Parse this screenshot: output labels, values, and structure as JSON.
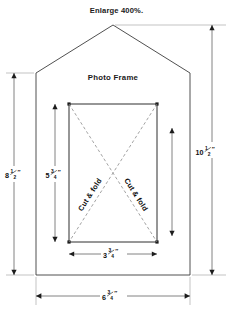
{
  "page": {
    "title": "Enlarge 400%.",
    "background_color": "#ffffff",
    "width": 233,
    "height": 312
  },
  "diagram": {
    "name": "photo-frame-cutting-template",
    "frame_label": "Photo Frame",
    "fold_label_left": "Cut & fold",
    "fold_label_right": "Cut & fold",
    "line_color": "#3c3c3c",
    "dash_color": "#8c8c8c",
    "dimension_color": "#5a5a5a"
  },
  "dimensions": [
    {
      "id": "overall-height-left",
      "value": "8",
      "fraction_num": "1",
      "fraction_den": "2",
      "unit": "″",
      "label": "8 1/2\"",
      "orientation": "vertical"
    },
    {
      "id": "opening-height",
      "value": "5",
      "fraction_num": "3",
      "fraction_den": "4",
      "unit": "″",
      "label": "5 3/4\"",
      "orientation": "vertical"
    },
    {
      "id": "overall-height-right",
      "value": "10",
      "fraction_num": "1",
      "fraction_den": "2",
      "unit": "″",
      "label": "10 1/2\"",
      "orientation": "vertical"
    },
    {
      "id": "opening-width",
      "value": "3",
      "fraction_num": "3",
      "fraction_den": "4",
      "unit": "″",
      "label": "3 3/4\"",
      "orientation": "horizontal"
    },
    {
      "id": "overall-width",
      "value": "6",
      "fraction_num": "3",
      "fraction_den": "4",
      "unit": "″",
      "label": "6 3/4\"",
      "orientation": "horizontal"
    }
  ]
}
